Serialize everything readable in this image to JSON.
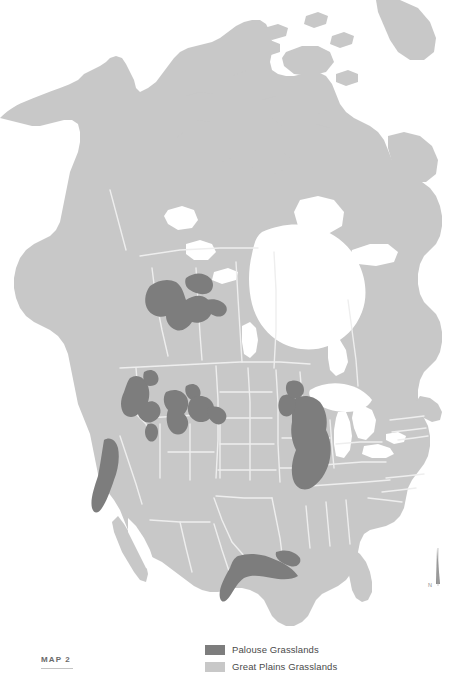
{
  "map": {
    "title": "North America Grasslands Distribution",
    "caption_label": "MAP 2",
    "colors": {
      "background": "#ffffff",
      "land": "#c8c8c8",
      "land_shadow": "#c0c0c0",
      "water": "#ffffff",
      "border_line": "#eeeeee",
      "palouse": "#7d7d7d",
      "great_plains": "#c8c8c8",
      "text": "#4a4a4a",
      "caption_text": "#6a6a6a",
      "compass": "#8d8d8d"
    },
    "projection_note": "Lambert-style conic, North America, Alaska to Florida"
  },
  "legend": {
    "items": [
      {
        "label": "Palouse Grasslands",
        "color": "#7d7d7d",
        "key": "palouse"
      },
      {
        "label": "Great Plains Grasslands",
        "color": "#c8c8c8",
        "key": "great-plains"
      }
    ]
  },
  "compass": {
    "label": "N",
    "orientation": "north-up"
  },
  "regions": {
    "highlighted": [
      {
        "name": "Northern Alberta / Peace River",
        "shade": "dark"
      },
      {
        "name": "Palouse / Columbia Plateau",
        "shade": "dark"
      },
      {
        "name": "Snake River Plain",
        "shade": "dark"
      },
      {
        "name": "California Central Valley",
        "shade": "dark"
      },
      {
        "name": "Upper Midwest Prairie Peninsula",
        "shade": "dark"
      },
      {
        "name": "Texas Gulf Coast Prairie",
        "shade": "dark"
      }
    ]
  }
}
